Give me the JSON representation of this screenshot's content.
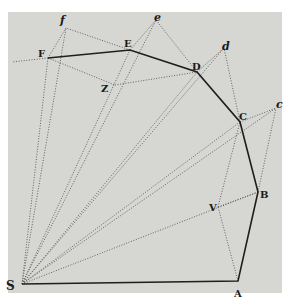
{
  "diagram": {
    "background": "#d6d6d3",
    "frame": {
      "x": 8,
      "y": 12,
      "w": 274,
      "h": 281
    },
    "points": {
      "S": {
        "label": "S",
        "x": 22,
        "y": 284
      },
      "A": {
        "label": "A",
        "x": 238,
        "y": 281
      },
      "B": {
        "label": "B",
        "x": 258,
        "y": 192
      },
      "C": {
        "label": "C",
        "x": 240,
        "y": 122
      },
      "D": {
        "label": "D",
        "x": 197,
        "y": 72
      },
      "E": {
        "label": "E",
        "x": 130,
        "y": 50
      },
      "F": {
        "label": "F",
        "x": 48,
        "y": 58
      },
      "V": {
        "label": "V",
        "x": 218,
        "y": 207
      },
      "Z": {
        "label": "Z",
        "x": 115,
        "y": 85
      },
      "c": {
        "label": "c",
        "x": 276,
        "y": 108
      },
      "d": {
        "label": "d",
        "x": 224,
        "y": 48
      },
      "e": {
        "label": "e",
        "x": 156,
        "y": 20
      },
      "f": {
        "label": "f",
        "x": 66,
        "y": 28
      }
    },
    "labels": {
      "S": "S",
      "A": "A",
      "B": "B",
      "C": "C",
      "D": "D",
      "E": "E",
      "F": "F",
      "V": "V",
      "Z": "Z",
      "c": "c",
      "d": "d",
      "e": "e",
      "f": "f"
    },
    "solid_path": [
      "S",
      "A",
      "B",
      "C",
      "D",
      "E",
      "F"
    ],
    "dotted_lines": [
      [
        "S",
        "B"
      ],
      [
        "S",
        "C"
      ],
      [
        "S",
        "c"
      ],
      [
        "S",
        "D"
      ],
      [
        "S",
        "d"
      ],
      [
        "S",
        "E"
      ],
      [
        "S",
        "e"
      ],
      [
        "S",
        "F"
      ],
      [
        "S",
        "f"
      ],
      [
        "A",
        "V"
      ],
      [
        "V",
        "C"
      ],
      [
        "B",
        "c"
      ],
      [
        "C",
        "d"
      ],
      [
        "D",
        "e"
      ],
      [
        "E",
        "f"
      ],
      [
        "C",
        "c"
      ],
      [
        "D",
        "d"
      ],
      [
        "E",
        "e"
      ],
      [
        "F",
        "f"
      ],
      [
        "F",
        "Z"
      ],
      [
        "Z",
        "d"
      ],
      [
        "F",
        "extF"
      ]
    ]
  }
}
